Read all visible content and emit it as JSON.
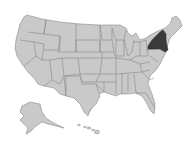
{
  "map": {
    "type": "choropleth",
    "region": "United States",
    "highlighted_states": [
      "New York"
    ],
    "colors": {
      "background": "#ffffff",
      "default_fill": "#c9c9c9",
      "highlight_fill": "#3a3a3a",
      "border": "#7a7a7a"
    },
    "insets": [
      "Alaska",
      "Hawaii"
    ]
  }
}
